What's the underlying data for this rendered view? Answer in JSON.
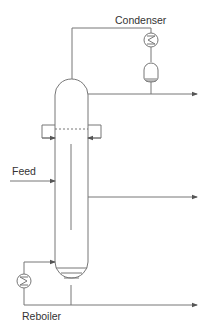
{
  "diagram": {
    "type": "distillation-column-process-flow",
    "labels": {
      "condenser": "Condenser",
      "feed": "Feed",
      "reboiler": "Reboiler"
    },
    "components": [
      {
        "id": "column",
        "name": "Distillation column"
      },
      {
        "id": "condenser",
        "name": "Condenser (heat exchanger)"
      },
      {
        "id": "reflux-drum",
        "name": "Reflux drum"
      },
      {
        "id": "reboiler",
        "name": "Reboiler (heat exchanger)"
      },
      {
        "id": "side-draw-tray",
        "name": "Side draw / feed tray"
      }
    ],
    "streams": [
      {
        "from": "column-top",
        "to": "condenser",
        "label": "vapor overhead"
      },
      {
        "from": "reflux-drum",
        "to": "distillate-outlet",
        "label": "distillate"
      },
      {
        "from": "feed",
        "to": "column",
        "label": "Feed"
      },
      {
        "from": "column-middle",
        "to": "side-product-outlet",
        "label": "side draw"
      },
      {
        "from": "column-bottom",
        "to": "bottoms-outlet",
        "label": "bottoms"
      },
      {
        "from": "reboiler",
        "to": "column-bottom",
        "label": "boil-up"
      }
    ],
    "colors": {
      "line": "#777777",
      "text": "#333333",
      "background": "#ffffff"
    }
  }
}
